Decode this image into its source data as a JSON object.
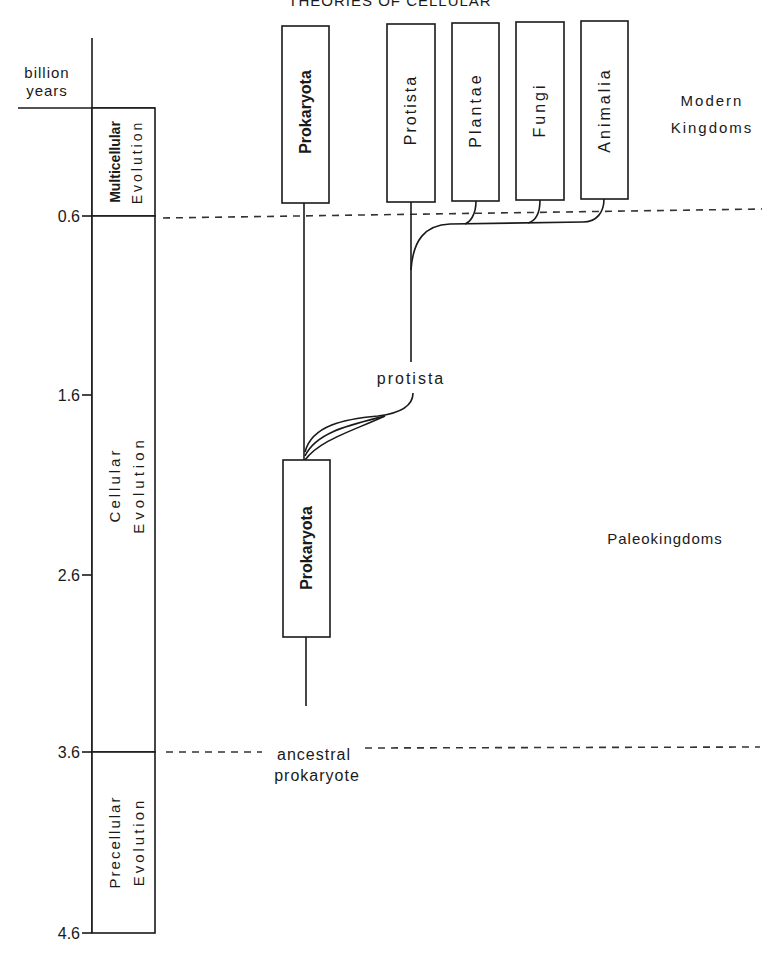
{
  "header": {
    "running_title": "THEORIES OF CELLULAR"
  },
  "axis": {
    "unit_label_line1": "billion",
    "unit_label_line2": "years",
    "ticks": [
      {
        "label": "0.6",
        "y": 216
      },
      {
        "label": "1.6",
        "y": 395
      },
      {
        "label": "2.6",
        "y": 575
      },
      {
        "label": "3.6",
        "y": 752
      },
      {
        "label": "4.6",
        "y": 933
      }
    ]
  },
  "eras": [
    {
      "line1": "Multicellular",
      "line2": "Evolution"
    },
    {
      "line1": "Cellular",
      "line2": "Evolution"
    },
    {
      "line1": "Precellular",
      "line2": "Evolution"
    }
  ],
  "modern_kingdoms": {
    "heading_line1": "Modern",
    "heading_line2": "Kingdoms",
    "boxes": [
      "Prokaryota",
      "Protista",
      "Plantae",
      "Fungi",
      "Animalia"
    ]
  },
  "paleo": {
    "heading": "Paleokingdoms",
    "box": "Prokaryota",
    "branch_label": "protista",
    "root_label_line1": "ancestral",
    "root_label_line2": "prokaryote"
  }
}
